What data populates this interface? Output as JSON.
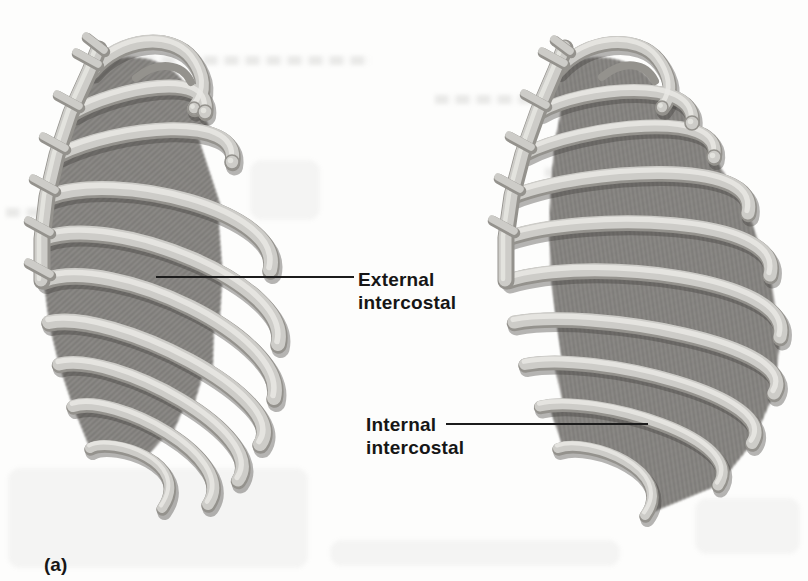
{
  "figure": {
    "panel_label": "(a)",
    "labels": [
      {
        "name": "external-intercostal",
        "line1": "External",
        "line2": "intercostal"
      },
      {
        "name": "internal-intercostal",
        "line1": "Internal",
        "line2": "intercostal"
      }
    ]
  },
  "illustrations": [
    {
      "name": "ribcage-external-intercostal",
      "description": "Rib cage, lateral view, external intercostal muscles"
    },
    {
      "name": "ribcage-internal-intercostal",
      "description": "Rib cage, lateral view, internal intercostal muscles"
    }
  ],
  "colors": {
    "background": "#fdfdfc",
    "bone": "#cdccc8",
    "bone_shadow": "#94928d",
    "bone_highlight": "#e9e8e4",
    "muscle": "#8d8b88",
    "muscle_fiber_dark": "#696865",
    "muscle_fiber_light": "#a3a19d",
    "leader_line": "#1c1c1c",
    "text": "#161616"
  }
}
